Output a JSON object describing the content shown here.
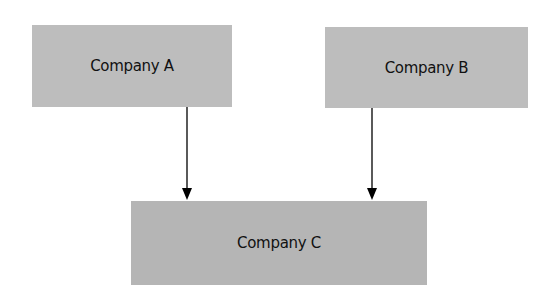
{
  "diagram": {
    "nodes": [
      {
        "id": "A",
        "label": "Company A"
      },
      {
        "id": "B",
        "label": "Company B"
      },
      {
        "id": "C",
        "label": "Company C"
      }
    ],
    "edges": [
      {
        "from": "A",
        "to": "C"
      },
      {
        "from": "B",
        "to": "C"
      }
    ],
    "colors": {
      "node_fill": "#bdbdbd",
      "arrow": "#000000",
      "background": "#ffffff"
    }
  }
}
